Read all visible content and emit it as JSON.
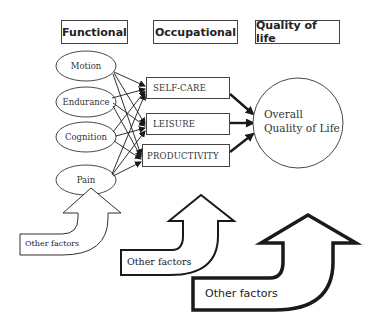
{
  "headers": {
    "functional": "Functional",
    "occupational": "Occupational",
    "quality_of_life": "Quality of life"
  },
  "functional_nodes": [
    "Motion",
    "Endurance",
    "Cognition",
    "Pain"
  ],
  "occupational_nodes": [
    "SELF-CARE",
    "LEISURE",
    "PRODUCTIVITY"
  ],
  "outcome": {
    "line1": "Overall",
    "line2": "Quality of Life"
  },
  "other_factors": [
    {
      "label": "Other factors",
      "weight": "thin"
    },
    {
      "label": "Other factors",
      "weight": "medium"
    },
    {
      "label": "Other factors",
      "weight": "thick"
    }
  ],
  "colors": {
    "stroke": "#1a1a1a",
    "background": "#ffffff"
  }
}
